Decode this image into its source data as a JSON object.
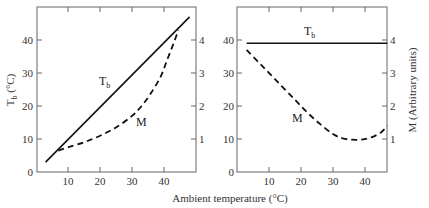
{
  "chart_data": [
    {
      "type": "line",
      "panel": "left",
      "xlabel": "Ambient temperature (°C)",
      "ylabel": "Tb (°C)",
      "ylabel_right": "",
      "x_ticks": [
        10,
        20,
        30,
        40
      ],
      "y_ticks": [
        0,
        10,
        20,
        30,
        40
      ],
      "y_ticks_right": [
        1,
        2,
        3,
        4
      ],
      "xlim": [
        0,
        50
      ],
      "ylim": [
        0,
        50
      ],
      "ylim_right": [
        0,
        5
      ],
      "grid": false,
      "series": [
        {
          "name": "Tb",
          "style": "solid",
          "axis": "left",
          "x": [
            3,
            48
          ],
          "y": [
            3,
            47
          ]
        },
        {
          "name": "M",
          "style": "dashed",
          "axis": "right",
          "x": [
            7,
            10,
            15,
            20,
            25,
            30,
            33,
            36,
            39,
            41,
            43,
            44.5
          ],
          "y": [
            0.65,
            0.75,
            0.9,
            1.1,
            1.35,
            1.7,
            2.0,
            2.4,
            2.9,
            3.4,
            3.9,
            4.3
          ]
        }
      ],
      "annotations": [
        {
          "text": "Tb",
          "x": 22,
          "y": 27
        },
        {
          "text": "M",
          "x": 32,
          "y": 15
        }
      ]
    },
    {
      "type": "line",
      "panel": "right",
      "xlabel": "Ambient temperature (°C)",
      "ylabel": "",
      "ylabel_right": "M (Arbitrary units)",
      "x_ticks": [
        10,
        20,
        30,
        40
      ],
      "y_ticks": [
        0,
        10,
        20,
        30,
        40
      ],
      "y_ticks_right": [
        1,
        2,
        3,
        4
      ],
      "xlim": [
        0,
        50
      ],
      "ylim": [
        0,
        50
      ],
      "ylim_right": [
        0,
        5
      ],
      "grid": false,
      "series": [
        {
          "name": "Tb",
          "style": "solid",
          "axis": "left",
          "x": [
            3,
            47
          ],
          "y": [
            39,
            39
          ]
        },
        {
          "name": "M",
          "style": "dashed",
          "axis": "right",
          "x": [
            3,
            8,
            13,
            18,
            22,
            26,
            30,
            33,
            36,
            39,
            42,
            45,
            47
          ],
          "y": [
            3.7,
            3.2,
            2.7,
            2.2,
            1.8,
            1.45,
            1.15,
            1.02,
            0.98,
            0.98,
            1.05,
            1.2,
            1.4
          ]
        }
      ],
      "annotations": [
        {
          "text": "Tb",
          "x": 23,
          "y": 42
        },
        {
          "text": "M",
          "x": 17,
          "y": 16
        }
      ]
    }
  ],
  "labels": {
    "x_axis_title": "Ambient temperature (°C)",
    "left_y_axis_title_main": "T",
    "left_y_axis_title_sub": "b",
    "left_y_axis_title_unit": " (°C)",
    "right_y_axis_title": "M (Arbitrary units)",
    "curve_tb_main": "T",
    "curve_tb_sub": "b",
    "curve_m": "M",
    "tick_10": "10",
    "tick_20": "20",
    "tick_30": "30",
    "tick_40": "40",
    "tick_0": "0",
    "tick_r1": "1",
    "tick_r2": "2",
    "tick_r3": "3",
    "tick_r4": "4"
  },
  "colors": {
    "line": "#111111",
    "axis": "#666666",
    "background": "#ffffff"
  }
}
